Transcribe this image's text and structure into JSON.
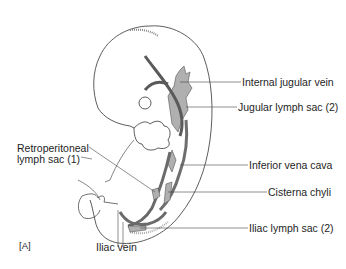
{
  "figure": {
    "panel_label": "[A]",
    "colors": {
      "outline": "#333333",
      "vessel": "#6e6e6e",
      "sac": "#b0b0b0",
      "leader": "#444444"
    },
    "labels": {
      "internal_jugular_vein": "Internal jugular vein",
      "jugular_lymph_sac": "Jugular lymph sac (2)",
      "retroperitoneal_line1": "Retroperitoneal",
      "retroperitoneal_line2": "lymph sac (1)",
      "inferior_vena_cava": "Inferior vena cava",
      "cisterna_chyli": "Cisterna chyli",
      "iliac_lymph_sac": "Iliac lymph sac (2)",
      "iliac_vein": "Iliac vein"
    }
  }
}
